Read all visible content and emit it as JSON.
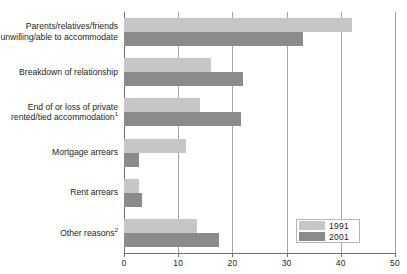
{
  "chart_data": {
    "type": "bar",
    "orientation": "horizontal",
    "title": "",
    "xlabel": "",
    "ylabel": "",
    "xlim": [
      0,
      50
    ],
    "grid": true,
    "gridlines": [
      0,
      10,
      20,
      30,
      40,
      50
    ],
    "xticks": [
      "0",
      "10",
      "20",
      "30",
      "40",
      "50"
    ],
    "legend_position": "bottom-right",
    "categories": [
      "Parents/relatives/friends unwilling/able to accommodate",
      "Breakdown of relationship",
      "End of or loss of private rented/tied accommodation",
      "Mortgage arrears",
      "Rent arrears",
      "Other reasons"
    ],
    "category_lines": [
      [
        "Parents/relatives/friends",
        "unwilling/able to accommodate"
      ],
      [
        "Breakdown of relationship"
      ],
      [
        "End of or loss of private",
        "rented/tied accommodation"
      ],
      [
        "Mortgage arrears"
      ],
      [
        "Rent arrears"
      ],
      [
        "Other reasons"
      ]
    ],
    "category_footnotes": [
      "",
      "",
      "1",
      "",
      "",
      "2"
    ],
    "series": [
      {
        "name": "1991",
        "color": "#c6c6c6",
        "values": [
          42,
          16,
          14,
          11.5,
          2.7,
          13.5
        ]
      },
      {
        "name": "2001",
        "color": "#8b8b8b",
        "values": [
          33,
          22,
          21.5,
          2.8,
          3.3,
          17.5
        ]
      }
    ]
  },
  "legend": {
    "items": [
      {
        "label": "1991"
      },
      {
        "label": "2001"
      }
    ]
  },
  "colors": {
    "series_1991": "#c6c6c6",
    "series_2001": "#8b8b8b",
    "axis": "#6f6f6f",
    "grid": "#a7a7a7",
    "text": "#231f20",
    "background": "#ffffff"
  }
}
